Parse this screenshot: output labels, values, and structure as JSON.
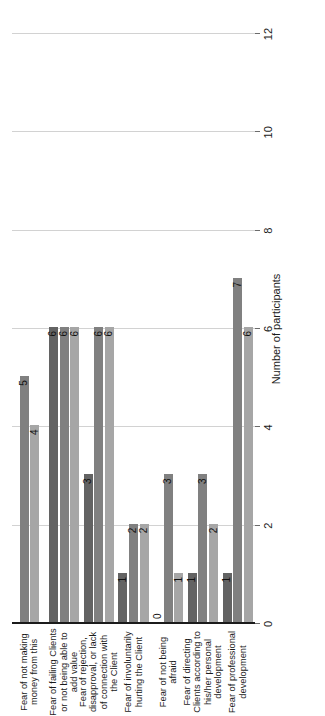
{
  "chart_data": {
    "type": "bar",
    "orientation": "horizontal",
    "title": "",
    "xlabel": "Number of participants",
    "ylabel": "",
    "xlim": [
      0,
      12
    ],
    "xticks": [
      "0",
      "2",
      "4",
      "6",
      "8",
      "10",
      "12"
    ],
    "grid": true,
    "legend": "none",
    "categories": [
      "Fear of not making money from this",
      "Fear of failing Clients or not being able to add value",
      "Fear of rejection, disapproval, or lack of connection with the Client",
      "Fear of involuntarily hurting the Client",
      "Fear of not being afraid",
      "Fear of directing Clients according to his/her personal development",
      "Fear of professional development"
    ],
    "series": [
      {
        "name": "series-1-dark",
        "color": "#636363",
        "values": [
          null,
          6,
          3,
          1,
          0,
          1,
          1
        ]
      },
      {
        "name": "series-2-medium",
        "color": "#808080",
        "values": [
          5,
          6,
          6,
          2,
          3,
          3,
          7
        ]
      },
      {
        "name": "series-3-light",
        "color": "#a6a6a6",
        "values": [
          4,
          6,
          6,
          2,
          1,
          2,
          6
        ]
      }
    ],
    "bar_labels": {
      "Fear of not making money from this": [
        "",
        "5",
        "4"
      ],
      "Fear of failing Clients or not being able to add value": [
        "6",
        "6",
        "6"
      ],
      "Fear of rejection, disapproval, or lack of connection with the Client": [
        "3",
        "6",
        "6"
      ],
      "Fear of involuntarily hurting the Client": [
        "1",
        "2",
        "2"
      ],
      "Fear of not being afraid": [
        "0",
        "3",
        "1"
      ],
      "Fear of directing Clients according to his/her personal development": [
        "1",
        "3",
        "2"
      ],
      "Fear of professional development": [
        "1",
        "7",
        "6"
      ]
    },
    "colors": {
      "axis": "#1b1b1b",
      "gridline": "#d2d2d2",
      "background": "#ffffff",
      "text": "#1b1b1b"
    }
  }
}
